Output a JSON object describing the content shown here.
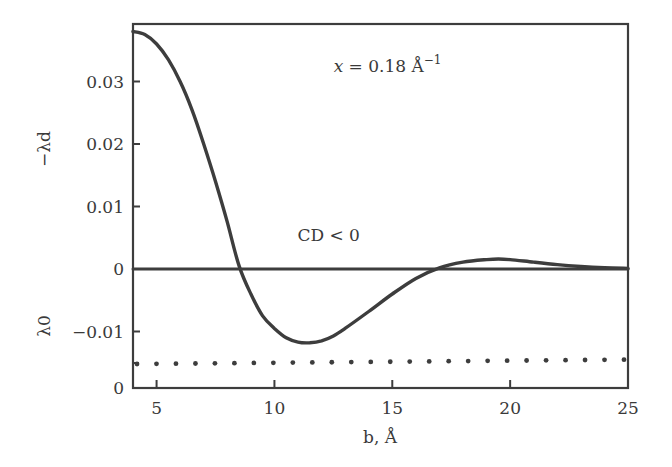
{
  "chart_data": {
    "type": "line",
    "title": "",
    "xlabel": "b, Å",
    "ylabel_upper": "−λd",
    "ylabel_lower": "λ0",
    "xlim": [
      4,
      25
    ],
    "ylim": [
      -0.019,
      0.039
    ],
    "x_ticks": [
      5,
      10,
      15,
      20,
      25
    ],
    "x_tick_labels": [
      "5",
      "10",
      "15",
      "20",
      "25"
    ],
    "y_ticks": [
      0.03,
      0.02,
      0.01,
      0,
      -0.01,
      -0.019
    ],
    "y_tick_labels": [
      "0.03",
      "0.02",
      "0.01",
      "0",
      "−0.01",
      "0"
    ],
    "grid": false,
    "legend": null,
    "annotations": [
      {
        "text": "x = 0.18 Å",
        "superscript": "−1",
        "x": 14.8,
        "y": 0.0315
      },
      {
        "text": "CD < 0",
        "x": 12.3,
        "y": 0.0045
      }
    ],
    "series": [
      {
        "name": "−λd",
        "style": "solid",
        "x": [
          4,
          4.5,
          5,
          5.5,
          6,
          6.5,
          7,
          7.5,
          8,
          8.5,
          9,
          9.5,
          10,
          10.5,
          11,
          11.5,
          12,
          12.5,
          13,
          14,
          15,
          16,
          17,
          18,
          19,
          19.5,
          20,
          21,
          22,
          23,
          24,
          25
        ],
        "y": [
          0.038,
          0.0375,
          0.036,
          0.0335,
          0.03,
          0.0255,
          0.02,
          0.014,
          0.0075,
          0.0005,
          -0.004,
          -0.0075,
          -0.0095,
          -0.011,
          -0.0117,
          -0.0118,
          -0.0115,
          -0.0107,
          -0.0095,
          -0.0068,
          -0.004,
          -0.0015,
          0.0002,
          0.0011,
          0.0015,
          0.0016,
          0.0015,
          0.0011,
          0.0007,
          0.0004,
          0.0002,
          0.0001
        ]
      },
      {
        "name": "zero-line",
        "style": "solid",
        "x": [
          4,
          25
        ],
        "y": [
          0,
          0
        ]
      },
      {
        "name": "λ0",
        "style": "dotted",
        "x": [
          4,
          25
        ],
        "y": [
          -0.0152,
          -0.0145
        ]
      }
    ]
  }
}
